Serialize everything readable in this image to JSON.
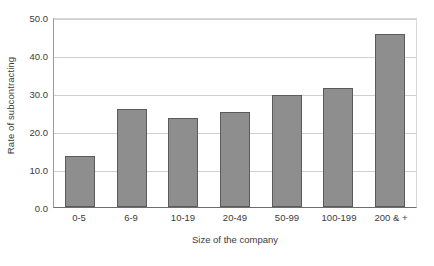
{
  "chart_data": {
    "type": "bar",
    "title": "",
    "subtitle": "",
    "xlabel": "Size of the company",
    "ylabel": "Rate of subcontracting",
    "categories": [
      "0-5",
      "6-9",
      "10-19",
      "20-49",
      "50-99",
      "100-199",
      "200 & +"
    ],
    "values": [
      13.5,
      25.8,
      23.5,
      25.1,
      29.4,
      31.2,
      45.6
    ],
    "ylim": [
      0.0,
      50.0
    ],
    "ytick_labels": [
      "50.0",
      "40.0",
      "30.0",
      "20.0",
      "10.0",
      "0.0"
    ],
    "ytick_values": [
      50.0,
      40.0,
      30.0,
      20.0,
      10.0,
      0.0
    ],
    "grid": true,
    "grid_axis": "y",
    "legend": false,
    "legend_position": "none",
    "bar_color": "#8e8e8e",
    "bar_border_color": "#5b5b5b",
    "gridline_color": "#d0d0d0",
    "axis_color": "#6e6e6e",
    "background_color": "#ffffff",
    "text_color": "#3b3b3b"
  }
}
